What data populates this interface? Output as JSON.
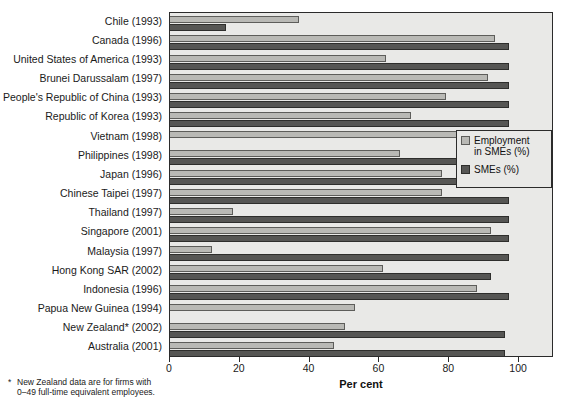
{
  "chart_data": {
    "type": "bar",
    "orientation": "horizontal",
    "title": "",
    "xlabel": "Per cent",
    "ylabel": "",
    "xlim": [
      0,
      110
    ],
    "xticks": [
      0,
      20,
      40,
      60,
      80,
      100
    ],
    "xticklabels": [
      "0",
      "20",
      "40",
      "60",
      "80",
      "100"
    ],
    "grid": false,
    "legend_position": "right-middle",
    "categories": [
      "Chile (1993)",
      "Canada (1996)",
      "United States of America (1993)",
      "Brunei Darussalam (1997)",
      "People's Republic of China (1993)",
      "Republic of Korea (1993)",
      "Vietnam (1998)",
      "Philippines (1998)",
      "Japan (1996)",
      "Chinese Taipei (1997)",
      "Thailand (1997)",
      "Singapore (2001)",
      "Malaysia (1997)",
      "Hong Kong SAR (2002)",
      "Indonesia (1996)",
      "Papua New Guinea (1994)",
      "New Zealand* (2002)",
      "Australia (2001)"
    ],
    "series": [
      {
        "name": "Employment in SMEs (%)",
        "color": "#b9b9b5",
        "values": [
          37,
          93,
          62,
          91,
          79,
          69,
          85,
          66,
          78,
          78,
          18,
          92,
          12,
          61,
          88,
          53,
          50,
          47
        ]
      },
      {
        "name": "SMEs (%)",
        "color": "#565654",
        "values": [
          16,
          97,
          97,
          97,
          97,
          97,
          null,
          97,
          97,
          97,
          97,
          97,
          97,
          92,
          97,
          null,
          96,
          96
        ]
      }
    ]
  },
  "axis": {
    "x_title": "Per cent"
  },
  "legend": {
    "entries": [
      {
        "label_line1": "Employment",
        "label_line2": "in SMEs (%)",
        "swatch": "light-gray-swatch"
      },
      {
        "label_line1": "SMEs (%)",
        "label_line2": "",
        "swatch": "dark-gray-swatch"
      }
    ]
  },
  "footnote": {
    "marker": "*",
    "line1": "New Zealand data are for firms with",
    "line2": "0–49 full-time equivalent employees."
  }
}
